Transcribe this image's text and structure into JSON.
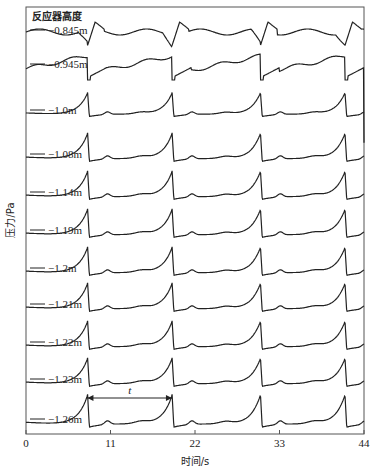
{
  "chart_data": {
    "type": "line",
    "legend_title": "反应器高度",
    "xlabel": "时间/s",
    "ylabel": "压力/Pa",
    "xlim": [
      0,
      44
    ],
    "xticks": [
      0,
      11,
      22,
      33,
      44
    ],
    "grid": false,
    "period_annotation": {
      "label": "t",
      "from": 8.0,
      "to": 19.0
    },
    "series": [
      {
        "name": "-0.845m",
        "shape": "sawtooth-drop",
        "drops": [
          8.0,
          19.0,
          30.5,
          41.5
        ]
      },
      {
        "name": "-0.945m",
        "shape": "sawtooth-drop",
        "drops": [
          8.0,
          19.0,
          30.5,
          41.5
        ]
      },
      {
        "name": "-1.0m",
        "shape": "spike",
        "peaks": [
          8.0,
          19.0,
          30.5,
          41.5
        ]
      },
      {
        "name": "-1.08m",
        "shape": "spike",
        "peaks": [
          8.0,
          19.0,
          30.5,
          41.5
        ]
      },
      {
        "name": "-1.14m",
        "shape": "spike",
        "peaks": [
          8.0,
          19.0,
          30.5,
          41.5
        ]
      },
      {
        "name": "-1.19m",
        "shape": "spike",
        "peaks": [
          8.0,
          19.0,
          30.5,
          41.5
        ]
      },
      {
        "name": "-1.2m",
        "shape": "spike",
        "peaks": [
          8.0,
          19.0,
          30.5,
          41.5
        ]
      },
      {
        "name": "-1.21m",
        "shape": "spike",
        "peaks": [
          8.0,
          19.0,
          30.5,
          41.5
        ]
      },
      {
        "name": "-1.22m",
        "shape": "spike",
        "peaks": [
          8.0,
          19.0,
          30.5,
          41.5
        ]
      },
      {
        "name": "-1.23m",
        "shape": "spike",
        "peaks": [
          8.0,
          19.0,
          30.5,
          41.5
        ]
      },
      {
        "name": "-1.26m",
        "shape": "spike",
        "peaks": [
          8.0,
          19.0,
          30.5,
          41.5
        ]
      }
    ]
  }
}
